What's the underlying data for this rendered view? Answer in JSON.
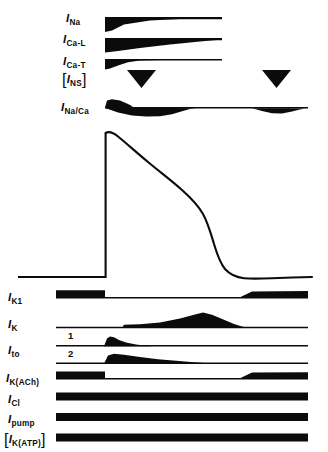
{
  "figure": {
    "background_color": "#ffffff",
    "ink_color": "#0b0b0b",
    "width": 328,
    "height": 452
  },
  "upper_currents": [
    {
      "id": "i-na",
      "base": "I",
      "sub": "Na",
      "bracketed": false,
      "label_x": 66,
      "label_y": 9,
      "shape": "inward-spike-decay",
      "direction": "inward"
    },
    {
      "id": "i-ca-l",
      "base": "I",
      "sub": "Ca-L",
      "bracketed": false,
      "label_x": 63,
      "label_y": 30,
      "shape": "inward-sustained-taper",
      "direction": "inward"
    },
    {
      "id": "i-ca-t",
      "base": "I",
      "sub": "Ca-T",
      "bracketed": false,
      "label_x": 63,
      "label_y": 52,
      "shape": "inward-fast-taper",
      "direction": "inward"
    },
    {
      "id": "i-ns",
      "base": "I",
      "sub": "NS",
      "bracketed": true,
      "label_x": 62,
      "label_y": 70,
      "shape": "two-triangles",
      "direction": "inward"
    },
    {
      "id": "i-na-ca",
      "base": "I",
      "sub": "Na/Ca",
      "bracketed": false,
      "label_x": 61,
      "label_y": 98,
      "shape": "biphasic-lens",
      "direction": "biphasic"
    }
  ],
  "action_potential": {
    "id": "action-potential-trace",
    "description": "Ventricular action potential: rapid upstroke, notch, plateau, repolarisation, resting baseline",
    "upstroke_x": 105,
    "peak_y": 132,
    "baseline_y": 277,
    "phases": [
      "upstroke",
      "early-repolarisation",
      "plateau",
      "rapid-repolarisation",
      "rest"
    ]
  },
  "lower_currents": [
    {
      "id": "i-k1",
      "base": "I",
      "sub": "K1",
      "bracketed": false,
      "label_x": 8,
      "label_y": 288,
      "baseline_y": 296,
      "shape": "block-dip-block",
      "direction": "outward"
    },
    {
      "id": "i-k",
      "base": "I",
      "sub": "K",
      "bracketed": false,
      "label_x": 8,
      "label_y": 315,
      "baseline_y": 328,
      "shape": "slow-hump",
      "direction": "outward"
    },
    {
      "id": "i-to",
      "base": "I",
      "sub": "to",
      "bracketed": false,
      "label_x": 8,
      "label_y": 341,
      "baseline_y": 346,
      "shape": "transient-outward",
      "direction": "outward",
      "sub_traces": [
        {
          "number": "1",
          "label_x": 68,
          "label_y": 332,
          "baseline_y": 346
        },
        {
          "number": "2",
          "label_x": 68,
          "label_y": 349,
          "baseline_y": 364
        }
      ]
    },
    {
      "id": "i-k-ach",
      "base": "I",
      "sub": "K(ACh)",
      "bracketed": false,
      "label_x": 6,
      "label_y": 369,
      "baseline_y": 377,
      "shape": "block-dip-block",
      "direction": "outward"
    },
    {
      "id": "i-cl",
      "base": "I",
      "sub": "Cl",
      "bracketed": false,
      "label_x": 8,
      "label_y": 390,
      "baseline_y": 397,
      "shape": "constant-band",
      "direction": "outward"
    },
    {
      "id": "i-pump",
      "base": "I",
      "sub": "pump",
      "bracketed": false,
      "label_x": 8,
      "label_y": 410,
      "baseline_y": 418,
      "shape": "constant-band",
      "direction": "outward"
    },
    {
      "id": "i-k-atp",
      "base": "I",
      "sub": "K(ATP)",
      "bracketed": true,
      "label_x": 4,
      "label_y": 430,
      "baseline_y": 438,
      "shape": "constant-band",
      "direction": "outward"
    }
  ]
}
